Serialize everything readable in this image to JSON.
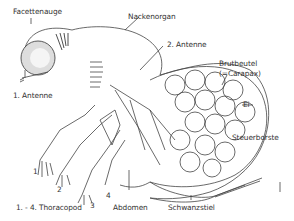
{
  "diagram": {
    "labels": {
      "facettenauge": "Facettenauge",
      "nackenorgan": "Nackenorgan",
      "antenne2": "2. Antenne",
      "brutbeutel": "Brutbeutel",
      "carapax": "(=Carapax)",
      "ei": "Ei",
      "antenne1": "1. Antenne",
      "steuerborste": "Steuerborste",
      "num1": "1",
      "num2": "2",
      "num3": "3",
      "num4": "4",
      "thoracopod": "1. - 4. Thoracopod",
      "abdomen": "Abdomen",
      "schwanzstiel": "Schwanzstiel"
    }
  }
}
